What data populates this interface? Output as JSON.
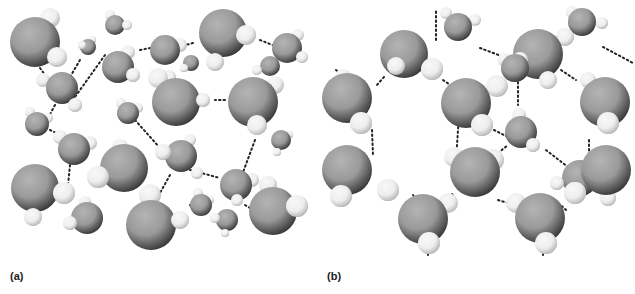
{
  "figure": {
    "panels": [
      {
        "id": "a",
        "label": "(a)",
        "description": "Liquid water: disordered molecules with transient hydrogen bonds",
        "bonds": [
          [
            40,
            68,
            45,
            75
          ],
          [
            80,
            60,
            67,
            82
          ],
          [
            105,
            55,
            75,
            97
          ],
          [
            140,
            50,
            155,
            47
          ],
          [
            193,
            43,
            178,
            47
          ],
          [
            260,
            40,
            275,
            46
          ],
          [
            225,
            100,
            215,
            100
          ],
          [
            55,
            105,
            48,
            118
          ],
          [
            50,
            130,
            70,
            140
          ],
          [
            70,
            165,
            68,
            185
          ],
          [
            135,
            120,
            160,
            148
          ],
          [
            190,
            170,
            220,
            178
          ],
          [
            255,
            140,
            242,
            175
          ],
          [
            245,
            205,
            250,
            208
          ],
          [
            170,
            175,
            160,
            193
          ],
          [
            190,
            205,
            195,
            213
          ]
        ],
        "molecules": [
          {
            "o": [
              35,
              42,
              25
            ],
            "h": [
              [
                50,
                18,
                10
              ],
              [
                57,
                57,
                10
              ]
            ]
          },
          {
            "o": [
              115,
              25,
              10
            ],
            "h": [
              [
                110,
                15,
                5
              ],
              [
                127,
                25,
                5
              ]
            ]
          },
          {
            "o": [
              88,
              47,
              8
            ],
            "h": [
              [
                82,
                45,
                4
              ],
              [
                92,
                40,
                4
              ]
            ]
          },
          {
            "o": [
              118,
              67,
              16
            ],
            "h": [
              [
                128,
                52,
                7
              ],
              [
                133,
                75,
                7
              ]
            ]
          },
          {
            "o": [
              165,
              50,
              15
            ],
            "h": [
              [
                180,
                45,
                7
              ],
              [
                168,
                78,
                8
              ]
            ]
          },
          {
            "o": [
              223,
              33,
              24
            ],
            "h": [
              [
                246,
                35,
                10
              ],
              [
                215,
                62,
                9
              ]
            ]
          },
          {
            "o": [
              287,
              48,
              15
            ],
            "h": [
              [
                298,
                35,
                6
              ],
              [
                302,
                57,
                6
              ]
            ]
          },
          {
            "o": [
              270,
              66,
              10
            ],
            "h": [
              [
                257,
                70,
                5
              ]
            ]
          },
          {
            "o": [
              62,
              88,
              16
            ],
            "h": [
              [
                43,
                80,
                7
              ],
              [
                75,
                105,
                7
              ]
            ]
          },
          {
            "o": [
              191,
              63,
              8
            ],
            "h": [
              [
                184,
                68,
                4
              ]
            ]
          },
          {
            "o": [
              176,
              102,
              24
            ],
            "h": [
              [
                158,
                78,
                10
              ],
              [
                203,
                100,
                7
              ]
            ]
          },
          {
            "o": [
              253,
              102,
              25
            ],
            "h": [
              [
                257,
                125,
                10
              ],
              [
                275,
                85,
                9
              ]
            ]
          },
          {
            "o": [
              128,
              113,
              11
            ],
            "h": [
              [
                121,
                103,
                5
              ],
              [
                138,
                108,
                5
              ]
            ]
          },
          {
            "o": [
              37,
              124,
              12
            ],
            "h": [
              [
                30,
                112,
                5
              ],
              [
                48,
                118,
                5
              ]
            ]
          },
          {
            "o": [
              74,
              149,
              16
            ],
            "h": [
              [
                60,
                137,
                7
              ],
              [
                90,
                143,
                7
              ]
            ]
          },
          {
            "o": [
              281,
              140,
              10
            ],
            "h": [
              [
                277,
                152,
                4
              ],
              [
                289,
                135,
                4
              ]
            ]
          },
          {
            "o": [
              124,
              168,
              24
            ],
            "h": [
              [
                98,
                177,
                11
              ],
              [
                120,
                147,
                8
              ]
            ]
          },
          {
            "o": [
              181,
              156,
              16
            ],
            "h": [
              [
                163,
                152,
                8
              ],
              [
                190,
                140,
                6
              ],
              [
                197,
                173,
                6
              ]
            ]
          },
          {
            "o": [
              35,
              188,
              24
            ],
            "h": [
              [
                64,
                193,
                11
              ],
              [
                33,
                217,
                9
              ]
            ]
          },
          {
            "o": [
              236,
              185,
              16
            ],
            "h": [
              [
                252,
                180,
                7
              ],
              [
                268,
                185,
                9
              ],
              [
                237,
                200,
                6
              ]
            ]
          },
          {
            "o": [
              87,
              218,
              16
            ],
            "h": [
              [
                70,
                223,
                7
              ],
              [
                85,
                202,
                6
              ]
            ]
          },
          {
            "o": [
              151,
              225,
              25
            ],
            "h": [
              [
                150,
                195,
                11
              ],
              [
                180,
                220,
                9
              ]
            ]
          },
          {
            "o": [
              201,
              205,
              11
            ],
            "h": [
              [
                198,
                193,
                5
              ],
              [
                210,
                200,
                4
              ]
            ]
          },
          {
            "o": [
              227,
              220,
              11
            ],
            "h": [
              [
                215,
                218,
                5
              ],
              [
                225,
                233,
                4
              ]
            ]
          },
          {
            "o": [
              273,
              211,
              24
            ],
            "h": [
              [
                297,
                206,
                11
              ]
            ]
          }
        ]
      },
      {
        "id": "b",
        "label": "(b)",
        "description": "Ice: ordered hexagonal lattice of hydrogen-bonded water molecules",
        "bonds": [
          [
            162,
            48,
            215,
            68
          ],
          [
            285,
            47,
            315,
            63
          ],
          [
            118,
            40,
            118,
            10
          ],
          [
            18,
            70,
            30,
            80
          ],
          [
            66,
            77,
            58,
            86
          ],
          [
            125,
            80,
            140,
            90
          ],
          [
            243,
            70,
            258,
            80
          ],
          [
            200,
            73,
            200,
            105
          ],
          [
            142,
            100,
            138,
            160
          ],
          [
            54,
            130,
            55,
            155
          ],
          [
            176,
            130,
            190,
            137
          ],
          [
            228,
            150,
            250,
            167
          ],
          [
            180,
            153,
            190,
            145
          ],
          [
            134,
            194,
            138,
            200
          ],
          [
            95,
            195,
            100,
            202
          ],
          [
            180,
            200,
            196,
            205
          ],
          [
            237,
            200,
            248,
            210
          ],
          [
            271,
            140,
            271,
            155
          ],
          [
            110,
            240,
            110,
            255
          ],
          [
            225,
            240,
            225,
            255
          ],
          [
            210,
            70,
            205,
            78
          ]
        ],
        "molecules": [
          {
            "o": [
              140,
              27,
              14
            ],
            "h": [
              [
                128,
                13,
                6
              ],
              [
                157,
                20,
                6
              ]
            ]
          },
          {
            "o": [
              264,
              22,
              14
            ],
            "h": [
              [
                254,
                12,
                6
              ],
              [
                284,
                23,
                6
              ],
              [
                247,
                37,
                9
              ]
            ]
          },
          {
            "o": [
              220,
              54,
              25
            ],
            "h": [
              [
                202,
                60,
                8
              ],
              [
                230,
                80,
                9
              ]
            ]
          },
          {
            "o": [
              86,
              54,
              24
            ],
            "h": [
              [
                78,
                66,
                9
              ],
              [
                114,
                69,
                11
              ]
            ]
          },
          {
            "o": [
              197,
              68,
              14
            ],
            "h": [
              [
                187,
                60,
                7
              ]
            ]
          },
          {
            "o": [
              29,
              98,
              25
            ],
            "h": [
              [
                25,
                77,
                8
              ],
              [
                43,
                123,
                11
              ]
            ]
          },
          {
            "o": [
              148,
              103,
              25
            ],
            "h": [
              [
                179,
                86,
                11
              ],
              [
                164,
                125,
                11
              ]
            ]
          },
          {
            "o": [
              287,
              102,
              25
            ],
            "h": [
              [
                270,
                80,
                8
              ],
              [
                290,
                123,
                11
              ]
            ]
          },
          {
            "o": [
              203,
              132,
              16
            ],
            "h": [
              [
                201,
                115,
                7
              ],
              [
                215,
                145,
                7
              ]
            ]
          },
          {
            "o": [
              29,
              170,
              25
            ],
            "h": [
              [
                23,
                196,
                11
              ],
              [
                70,
                190,
                11
              ]
            ]
          },
          {
            "o": [
              157,
              172,
              25
            ],
            "h": [
              [
                136,
                157,
                10
              ],
              [
                175,
                160,
                11
              ]
            ]
          },
          {
            "o": [
              262,
              178,
              18
            ],
            "h": [
              [
                239,
                183,
                7
              ],
              [
                290,
                198,
                8
              ]
            ]
          },
          {
            "o": [
              288,
              170,
              25
            ],
            "h": [
              [
                257,
                193,
                11
              ]
            ]
          },
          {
            "o": [
              105,
              219,
              25
            ],
            "h": [
              [
                130,
                203,
                10
              ],
              [
                111,
                243,
                11
              ]
            ]
          },
          {
            "o": [
              222,
              218,
              25
            ],
            "h": [
              [
                198,
                203,
                10
              ],
              [
                228,
                243,
                11
              ]
            ]
          }
        ]
      }
    ]
  },
  "colors": {
    "oxygen_light": "#9a9a9a",
    "oxygen_dark": "#3a3a3a",
    "hydrogen_light": "#eeeeee",
    "hydrogen_dark": "#b8b8b8",
    "bond": "#222222",
    "label": "#222222"
  }
}
